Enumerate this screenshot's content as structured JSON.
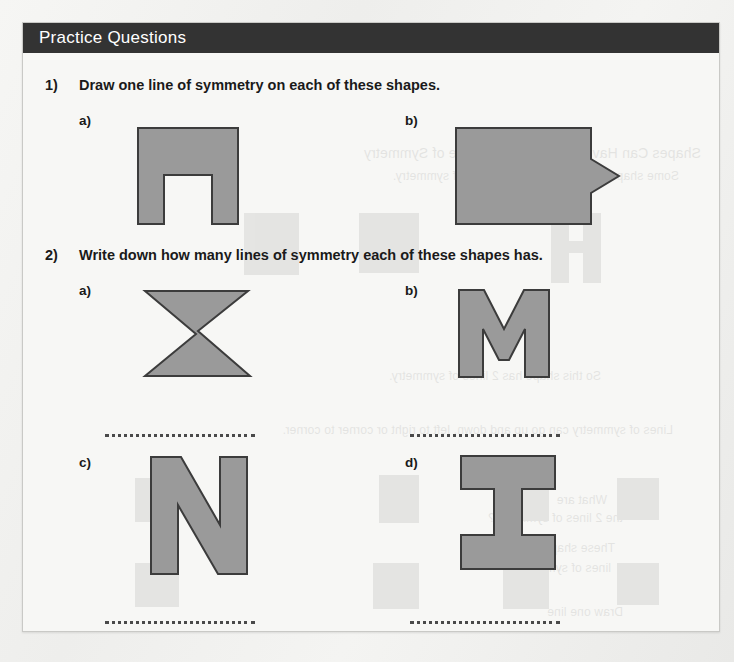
{
  "page": {
    "header_title": "Practice Questions",
    "header_bg": "#333333",
    "header_text_color": "#ffffff",
    "sheet_bg": "#f7f7f5",
    "shape_fill": "#9a9a9a",
    "shape_stroke": "#3c3c3c"
  },
  "questions": [
    {
      "number": "1)",
      "text": "Draw one line of symmetry on each of these shapes.",
      "parts": [
        {
          "label": "a)",
          "shape_name": "arch-shape",
          "answer_line": false
        },
        {
          "label": "b)",
          "shape_name": "arrow-tab-pentagon-shape",
          "answer_line": false
        }
      ]
    },
    {
      "number": "2)",
      "text": "Write down how many lines of symmetry each of these shapes has.",
      "parts": [
        {
          "label": "a)",
          "shape_name": "bowtie-hourglass-shape",
          "answer_line": true
        },
        {
          "label": "b)",
          "shape_name": "letter-m-shape",
          "answer_line": true
        },
        {
          "label": "c)",
          "shape_name": "letter-n-shape",
          "answer_line": true
        },
        {
          "label": "d)",
          "shape_name": "letter-i-beam-shape",
          "answer_line": true
        }
      ]
    }
  ],
  "bleed_through": {
    "lines": [
      {
        "text": "Shapes Can Have More Than One Line of Symmetry",
        "x": 18,
        "y": 122,
        "size": 14
      },
      {
        "text": "Some shapes have more than one line of symmetry.",
        "x": 40,
        "y": 146,
        "size": 12
      },
      {
        "text": "So this shape has 2 lines of symmetry.",
        "x": 118,
        "y": 346,
        "size": 12
      },
      {
        "text": "Lines of symmetry can go up and down, left to right or corner to corner.",
        "x": 46,
        "y": 400,
        "size": 12
      },
      {
        "text": "What are",
        "x": 112,
        "y": 470,
        "size": 12
      },
      {
        "text": "the 2 lines of symmetry?",
        "x": 96,
        "y": 488,
        "size": 12
      },
      {
        "text": "These shapes have 2",
        "x": 104,
        "y": 518,
        "size": 12
      },
      {
        "text": "lines of symmetry.",
        "x": 108,
        "y": 538,
        "size": 12
      },
      {
        "text": "Draw one line",
        "x": 96,
        "y": 582,
        "size": 12
      }
    ]
  }
}
